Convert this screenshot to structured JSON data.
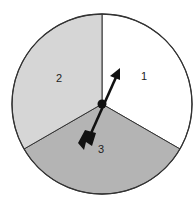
{
  "spinner": {
    "sections": [
      {
        "label": "1",
        "color": "#ffffff"
      },
      {
        "label": "2",
        "color": "#d6d6d6"
      },
      {
        "label": "3",
        "color": "#b4b4b4"
      }
    ],
    "outline_color": "#333333",
    "arrow_color": "#111111"
  }
}
